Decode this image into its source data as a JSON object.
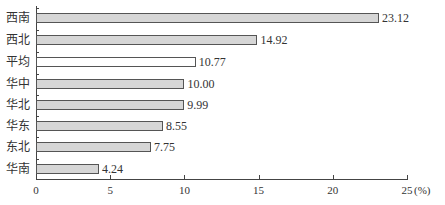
{
  "chart_data": {
    "type": "bar",
    "orientation": "horizontal",
    "title": "",
    "xlabel": "%",
    "ylabel": "",
    "xlim": [
      0,
      25
    ],
    "x_ticks": [
      "0",
      "5",
      "10",
      "15",
      "20",
      "25"
    ],
    "x_unit_label": "(%)",
    "categories": [
      "西南",
      "西北",
      "平均",
      "华中",
      "华北",
      "华东",
      "东北",
      "华南"
    ],
    "values": [
      23.12,
      14.92,
      10.77,
      10.0,
      9.99,
      8.55,
      7.75,
      4.24
    ],
    "value_labels": [
      "23.12",
      "14.92",
      "10.77",
      "10.00",
      "9.99",
      "8.55",
      "7.75",
      "4.24"
    ],
    "highlight": {
      "category": "平均",
      "fill": "#ffffff"
    },
    "bar_fill": "#d6d6d6",
    "bar_border": "#555555",
    "grid": false,
    "legend": null
  }
}
